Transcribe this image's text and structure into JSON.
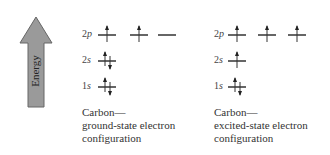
{
  "axis": {
    "label": "Energy",
    "arrow_color": "#999999"
  },
  "diagrams": [
    {
      "id": "ground",
      "caption": [
        "Carbon—",
        "ground-state electron",
        "configuration"
      ],
      "levels": [
        {
          "n": "2",
          "l": "p",
          "orbitals": [
            "up",
            "up",
            "empty"
          ]
        },
        {
          "n": "2",
          "l": "s",
          "orbitals": [
            "pair"
          ]
        },
        {
          "n": "1",
          "l": "s",
          "orbitals": [
            "pair"
          ]
        }
      ]
    },
    {
      "id": "excited",
      "caption": [
        "Carbon—",
        "excited-state electron",
        "configuration"
      ],
      "levels": [
        {
          "n": "2",
          "l": "p",
          "orbitals": [
            "up",
            "up",
            "up"
          ]
        },
        {
          "n": "2",
          "l": "s",
          "orbitals": [
            "up"
          ]
        },
        {
          "n": "1",
          "l": "s",
          "orbitals": [
            "pair"
          ]
        }
      ]
    }
  ]
}
